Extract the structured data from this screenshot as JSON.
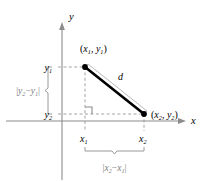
{
  "figure": {
    "type": "coordinate-geometry-diagram",
    "background_color": "#ffffff",
    "axes": {
      "x_label": "x",
      "y_label": "y",
      "axis_color": "#808080",
      "origin_px": [
        62,
        121
      ]
    },
    "points": [
      {
        "name": "point-1",
        "label": "(x₁, y₁)",
        "label_parts": {
          "open": "(",
          "x": "x",
          "x_sub": "1",
          "comma": ", ",
          "y": "y",
          "y_sub": "1",
          "close": ")"
        },
        "px": [
          85,
          67
        ],
        "color": "#000000"
      },
      {
        "name": "point-2",
        "label": "(x₂, y₂)",
        "label_parts": {
          "open": "(",
          "x": "x",
          "x_sub": "2",
          "comma": ", ",
          "y": "y",
          "y_sub": "2",
          "close": ")"
        },
        "px": [
          144,
          114
        ],
        "color": "#000000"
      }
    ],
    "segment": {
      "name": "distance-segment",
      "label": "d",
      "color": "#000000",
      "width_px": 2.6
    },
    "ticks": {
      "y1": {
        "base": "y",
        "sub": "1",
        "px": [
          54,
          69
        ]
      },
      "y2": {
        "base": "y",
        "sub": "2",
        "px": [
          54,
          117
        ]
      },
      "x1": {
        "base": "x",
        "sub": "1",
        "px": [
          83,
          139
        ]
      },
      "x2": {
        "base": "x",
        "sub": "2",
        "px": [
          142,
          139
        ]
      }
    },
    "brackets": {
      "vertical": {
        "name": "vertical-distance-bracket",
        "label_parts": {
          "bar1": "|",
          "y": "y",
          "sub2": "2",
          "minus": "−",
          "y2": "y",
          "sub1": "1",
          "bar2": "|"
        },
        "label_text": "|y₂ − y₁|",
        "color": "#808080",
        "span_px": [
          67,
          114
        ]
      },
      "horizontal": {
        "name": "horizontal-distance-bracket",
        "label_parts": {
          "bar1": "|",
          "x": "x",
          "sub2": "2",
          "minus": "−",
          "x2": "x",
          "sub1": "1",
          "bar2": "|"
        },
        "label_text": "|x₂ − x₁|",
        "color": "#808080",
        "span_px": [
          85,
          144
        ]
      }
    },
    "guides": {
      "color": "#999999",
      "style": "dashed",
      "right_angle_marker": true
    }
  }
}
